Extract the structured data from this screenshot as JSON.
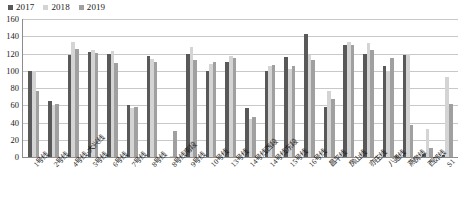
{
  "legend": {
    "position": "top-left",
    "entries": [
      {
        "label": "2017",
        "color": "#595959"
      },
      {
        "label": "2018",
        "color": "#d4d4d4"
      },
      {
        "label": "2019",
        "color": "#a0a0a0"
      }
    ]
  },
  "axis": {
    "yticks": [
      "0",
      "20",
      "40",
      "60",
      "80",
      "100",
      "120",
      "140",
      "160"
    ]
  },
  "chart_data": {
    "type": "bar",
    "title": "",
    "xlabel": "",
    "ylabel": "",
    "ylim": [
      0,
      160
    ],
    "ytick_step": 20,
    "grid": true,
    "legend_position": "top-left",
    "categories": [
      "1号线",
      "2号线",
      "4号线·大兴线",
      "5号线",
      "6号线",
      "7号线",
      "8号线",
      "8号线南段",
      "9号线",
      "10号线",
      "13号线",
      "14号线西段",
      "14号线东段",
      "15号线",
      "16号线",
      "昌平线",
      "房山线",
      "亦庄线",
      "八通线",
      "燕房线",
      "西郊线",
      "S1"
    ],
    "series": [
      {
        "name": "2017",
        "color": "#595959",
        "values": [
          100,
          65,
          118,
          122,
          120,
          60,
          117,
          null,
          120,
          100,
          110,
          57,
          100,
          116,
          143,
          58,
          130,
          120,
          105,
          118,
          4,
          2
        ]
      },
      {
        "name": "2018",
        "color": "#d4d4d4",
        "values": [
          100,
          60,
          133,
          124,
          123,
          57,
          114,
          1,
          128,
          108,
          117,
          44,
          106,
          102,
          118,
          77,
          133,
          132,
          100,
          120,
          32,
          93
        ]
      },
      {
        "name": "2019",
        "color": "#a0a0a0",
        "values": [
          77,
          62,
          125,
          121,
          109,
          58,
          110,
          30,
          113,
          110,
          115,
          46,
          107,
          105,
          112,
          67,
          130,
          124,
          115,
          37,
          10,
          62
        ]
      }
    ]
  }
}
